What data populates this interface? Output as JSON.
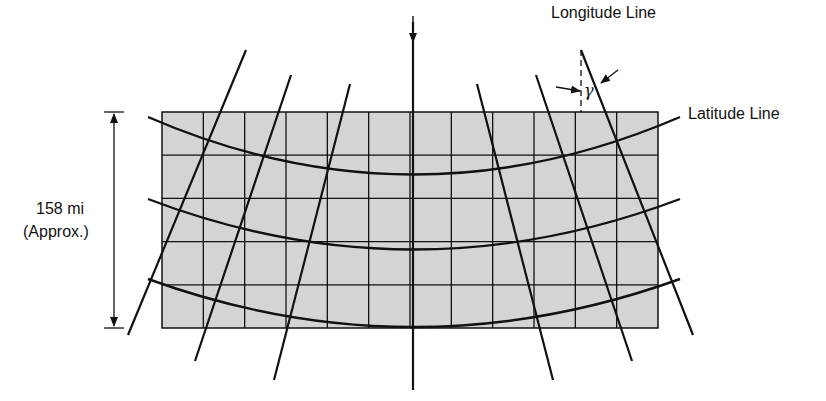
{
  "labels": {
    "longitude": "Longitude Line",
    "latitude": "Latitude Line",
    "angle_symbol": "γ",
    "distance": "158 mi",
    "approx": "(Approx.)"
  },
  "colors": {
    "grid_fill": "#d4d4d4",
    "line": "#111111"
  },
  "grid": {
    "x0": 162,
    "x1": 658,
    "y0": 112,
    "y1": 328,
    "cols": 12,
    "rows": 5
  }
}
